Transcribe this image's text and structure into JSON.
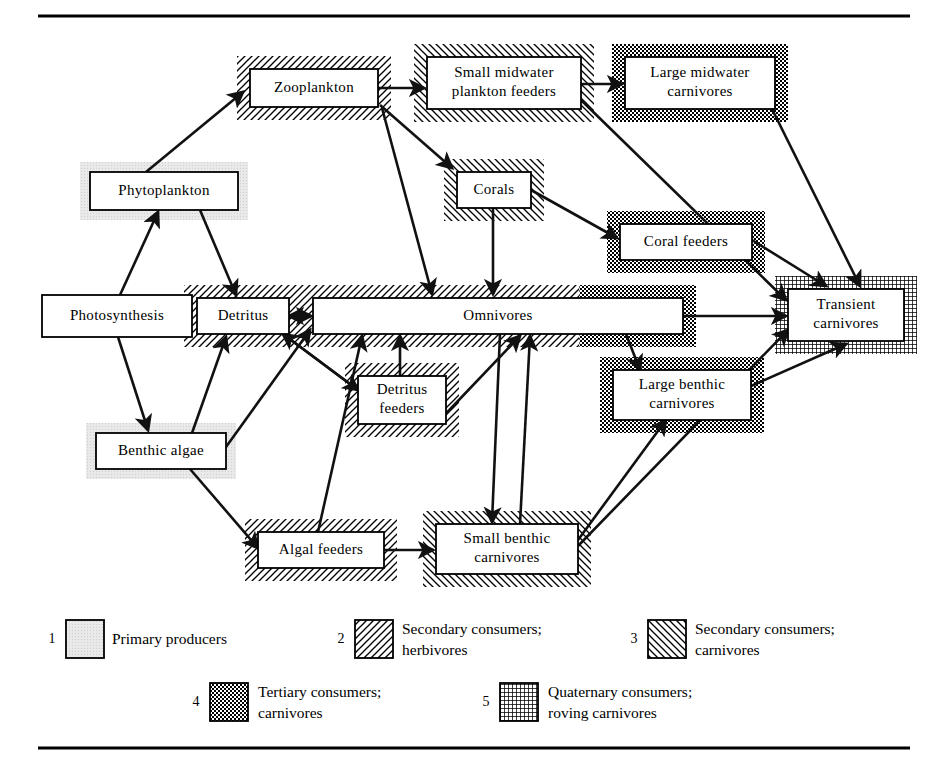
{
  "figure": {
    "top_rule": true,
    "bottom_rule": true
  },
  "categories": [
    {
      "id": 1,
      "key": "primary",
      "label_line1": "Primary producers",
      "label_line2": "",
      "pattern": "stipple-gray",
      "color": "#e8e8e8"
    },
    {
      "id": 2,
      "key": "secondary_h",
      "label_line1": "Secondary consumers;",
      "label_line2": "herbivores",
      "pattern": "hatch-fwd",
      "color": "#000000"
    },
    {
      "id": 3,
      "key": "secondary_c",
      "label_line1": "Secondary consumers;",
      "label_line2": "carnivores",
      "pattern": "hatch-back",
      "color": "#000000"
    },
    {
      "id": 4,
      "key": "tertiary",
      "label_line1": "Tertiary consumers;",
      "label_line2": "carnivores",
      "pattern": "checker",
      "color": "#000000"
    },
    {
      "id": 5,
      "key": "quaternary",
      "label_line1": "Quaternary consumers;",
      "label_line2": "roving carnivores",
      "pattern": "grid",
      "color": "#000000"
    }
  ],
  "nodes": [
    {
      "id": "photosynthesis",
      "label_line1": "Photosynthesis",
      "label_line2": "",
      "category": "none",
      "x": 42,
      "y": 295,
      "w": 150,
      "h": 42
    },
    {
      "id": "phytoplankton",
      "label_line1": "Phytoplankton",
      "label_line2": "",
      "category": "primary",
      "x": 90,
      "y": 172,
      "w": 148,
      "h": 38
    },
    {
      "id": "benthic_algae",
      "label_line1": "Benthic algae",
      "label_line2": "",
      "category": "primary",
      "x": 96,
      "y": 433,
      "w": 130,
      "h": 36
    },
    {
      "id": "detritus",
      "label_line1": "Detritus",
      "label_line2": "",
      "category": "secondary_h",
      "x": 197,
      "y": 298,
      "w": 92,
      "h": 36
    },
    {
      "id": "zooplankton",
      "label_line1": "Zooplankton",
      "label_line2": "",
      "category": "secondary_h",
      "x": 250,
      "y": 69,
      "w": 128,
      "h": 38
    },
    {
      "id": "small_midwater",
      "label_line1": "Small midwater",
      "label_line2": "plankton feeders",
      "category": "secondary_c",
      "x": 427,
      "y": 57,
      "w": 154,
      "h": 52
    },
    {
      "id": "large_midwater",
      "label_line1": "Large midwater",
      "label_line2": "carnivores",
      "category": "tertiary",
      "x": 625,
      "y": 57,
      "w": 150,
      "h": 52
    },
    {
      "id": "corals",
      "label_line1": "Corals",
      "label_line2": "",
      "category": "secondary_c",
      "x": 457,
      "y": 172,
      "w": 74,
      "h": 36
    },
    {
      "id": "coral_feeders",
      "label_line1": "Coral feeders",
      "label_line2": "",
      "category": "tertiary",
      "x": 620,
      "y": 224,
      "w": 132,
      "h": 36
    },
    {
      "id": "omnivores",
      "label_line1": "Omnivores",
      "label_line2": "",
      "category": "split_h_t",
      "x": 313,
      "y": 298,
      "w": 370,
      "h": 36
    },
    {
      "id": "detritus_feeders",
      "label_line1": "Detritus",
      "label_line2": "feeders",
      "category": "secondary_h",
      "x": 358,
      "y": 376,
      "w": 88,
      "h": 48
    },
    {
      "id": "large_benthic",
      "label_line1": "Large benthic",
      "label_line2": "carnivores",
      "category": "tertiary",
      "x": 613,
      "y": 370,
      "w": 138,
      "h": 50
    },
    {
      "id": "algal_feeders",
      "label_line1": "Algal feeders",
      "label_line2": "",
      "category": "secondary_h",
      "x": 258,
      "y": 532,
      "w": 126,
      "h": 36
    },
    {
      "id": "small_benthic",
      "label_line1": "Small benthic",
      "label_line2": "carnivores",
      "category": "secondary_c",
      "x": 436,
      "y": 524,
      "w": 142,
      "h": 50
    },
    {
      "id": "transient",
      "label_line1": "Transient",
      "label_line2": "carnivores",
      "category": "quaternary",
      "x": 788,
      "y": 289,
      "w": 116,
      "h": 52
    }
  ],
  "edges": [
    {
      "from": "photosynthesis",
      "to": "phytoplankton",
      "points": "120,295 158,212"
    },
    {
      "from": "photosynthesis",
      "to": "benthic_algae",
      "points": "118,337 148,430"
    },
    {
      "from": "phytoplankton",
      "to": "zooplankton",
      "points": "146,172 243,92"
    },
    {
      "from": "phytoplankton",
      "to": "detritus",
      "points": "200,210 236,295"
    },
    {
      "from": "benthic_algae",
      "to": "detritus",
      "points": "192,433 226,337"
    },
    {
      "from": "benthic_algae",
      "to": "algal_feeders",
      "points": "190,469 258,548"
    },
    {
      "from": "benthic_algae",
      "to": "omnivores",
      "points": "226,447 310,330"
    },
    {
      "from": "detritus",
      "to": "omnivores",
      "points": "289,316 311,316"
    },
    {
      "from": "omnivores",
      "to": "detritus",
      "points": "311,316 289,316"
    },
    {
      "from": "detritus",
      "to": "detritus_feeders",
      "points": "283,334 358,390"
    },
    {
      "from": "detritus_feeders",
      "to": "detritus",
      "points": "358,390 283,334"
    },
    {
      "from": "detritus_feeders",
      "to": "omnivores",
      "points": "400,376 400,336"
    },
    {
      "from": "detritus_feeders",
      "to": "omnivores",
      "points": "436,424 520,336"
    },
    {
      "from": "zooplankton",
      "to": "small_midwater",
      "points": "378,88 424,88"
    },
    {
      "from": "zooplankton",
      "to": "corals",
      "points": "380,105 452,168"
    },
    {
      "from": "zooplankton",
      "to": "omnivores",
      "points": "382,108 432,294"
    },
    {
      "from": "corals",
      "to": "omnivores",
      "points": "493,208 493,294"
    },
    {
      "from": "corals",
      "to": "coral_feeders",
      "points": "531,190 617,238"
    },
    {
      "from": "small_midwater",
      "to": "large_midwater",
      "points": "581,84 622,84"
    },
    {
      "from": "small_midwater",
      "to": "transient",
      "points": "581,100 786,300"
    },
    {
      "from": "large_midwater",
      "to": "transient",
      "points": "772,109 860,286"
    },
    {
      "from": "coral_feeders",
      "to": "transient",
      "points": "752,240 826,286"
    },
    {
      "from": "omnivores",
      "to": "transient",
      "points": "683,316 786,316"
    },
    {
      "from": "omnivores",
      "to": "large_benthic",
      "points": "626,334 640,370"
    },
    {
      "from": "small_benthic",
      "to": "omnivores",
      "points": "520,524 530,336"
    },
    {
      "from": "algal_feeders",
      "to": "omnivores",
      "points": "318,532 362,336"
    },
    {
      "from": "algal_feeders",
      "to": "small_benthic",
      "points": "384,550 433,550"
    },
    {
      "from": "small_benthic",
      "to": "large_benthic",
      "points": "578,540 666,420"
    },
    {
      "from": "small_benthic",
      "to": "transient",
      "points": "578,546 788,330"
    },
    {
      "from": "large_benthic",
      "to": "transient",
      "points": "751,386 846,344"
    },
    {
      "from": "omnivores",
      "to": "small_benthic",
      "points": "500,334 492,522"
    }
  ]
}
